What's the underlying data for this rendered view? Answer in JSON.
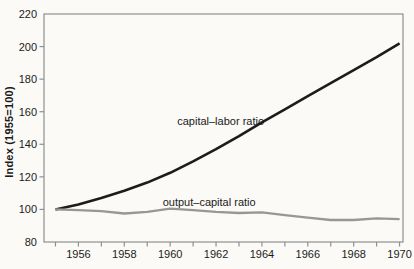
{
  "figure": {
    "background": "#fbfaf7",
    "axis_color": "#8f8f8f",
    "text_color": "#1a1a1a"
  },
  "chart_data": {
    "type": "line",
    "title": "",
    "xlabel": "",
    "ylabel": "Index  (1955=100)",
    "grid": false,
    "legend": "inline-labels",
    "xlim": [
      1954.5,
      1970.15
    ],
    "ylim": [
      80,
      220
    ],
    "y_ticks": [
      80,
      100,
      120,
      140,
      160,
      180,
      200,
      220
    ],
    "x_minor_tick_years": [
      1955,
      1956,
      1957,
      1958,
      1959,
      1960,
      1961,
      1962,
      1963,
      1964,
      1965,
      1966,
      1967,
      1968,
      1969,
      1970
    ],
    "x_label_years": [
      1956,
      1958,
      1960,
      1962,
      1964,
      1966,
      1968,
      1970
    ],
    "x": [
      1955,
      1956,
      1957,
      1958,
      1959,
      1960,
      1961,
      1962,
      1963,
      1964,
      1965,
      1966,
      1967,
      1968,
      1969,
      1970
    ],
    "series": [
      {
        "name": "capital–labor ratio",
        "color": "#1c1c1c",
        "stroke_width": 2.6,
        "values": [
          100,
          103,
          107,
          111.5,
          116.5,
          122.5,
          129.5,
          137,
          145,
          153.5,
          161.5,
          169.5,
          177.5,
          185.5,
          193.5,
          202
        ]
      },
      {
        "name": "output–capital ratio",
        "color": "#979797",
        "stroke_width": 2.3,
        "values": [
          100,
          99.5,
          99,
          97.5,
          98.5,
          100.5,
          99.5,
          98.5,
          97.8,
          98.2,
          96.5,
          95,
          93.5,
          93.5,
          94.5,
          94
        ]
      }
    ],
    "annotations": [
      {
        "text": "capital–labor ratio",
        "x": 1962.2,
        "y": 154
      },
      {
        "text": "output–capital ratio",
        "x": 1961.7,
        "y": 104.3
      }
    ]
  }
}
